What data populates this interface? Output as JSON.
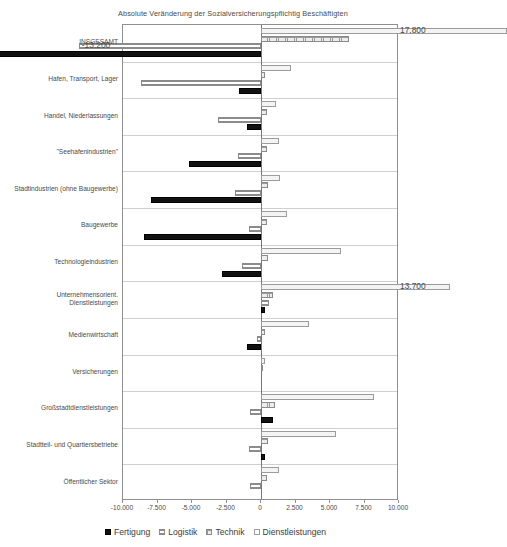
{
  "chart_data": {
    "type": "bar",
    "orientation": "horizontal",
    "grouped": true,
    "title": "Absolute Veränderung der Sozialversicherungspflichtig Beschäftigten",
    "xlabel": "",
    "ylabel": "",
    "xlim": [
      -10000,
      10000
    ],
    "xticks": [
      -10000,
      -7500,
      -5000,
      -2500,
      0,
      2500,
      5000,
      7500,
      10000
    ],
    "xtick_labels": [
      "-10.000",
      "-7.500",
      "-5.000",
      "-2.500",
      "0",
      "2.500",
      "5.000",
      "7.500",
      "10.000"
    ],
    "grid": true,
    "legend_position": "bottom",
    "categories": [
      "INSGESAMT",
      "Hafen, Transport, Lager",
      "Handel, Niederlassungen",
      "\"Seehafenindustrien\"",
      "Stadtindustrien (ohne Baugewerbe)",
      "Baugewerbe",
      "Technologieindustrien",
      "Unternehmensorient. Dienstleistungen",
      "Medienwirtschaft",
      "Versicherungen",
      "Großstadtdienstleistungen",
      "Stadtteil- und Quartiersbetriebe",
      "Öffentlicher Sektor"
    ],
    "series": [
      {
        "name": "Dienstleistungen",
        "values": [
          17800,
          2200,
          1100,
          1300,
          1400,
          1900,
          5800,
          13700,
          3500,
          300,
          8200,
          5400,
          1300
        ]
      },
      {
        "name": "Technik",
        "values": [
          6400,
          300,
          400,
          400,
          500,
          400,
          500,
          900,
          300,
          100,
          1000,
          500,
          400
        ]
      },
      {
        "name": "Logistik",
        "values": [
          -13200,
          -8700,
          -3100,
          -1700,
          -1900,
          -900,
          -1400,
          600,
          -300,
          0,
          -800,
          -900,
          -800
        ]
      },
      {
        "name": "Fertigung",
        "values": [
          -24500,
          -1600,
          -1000,
          -5200,
          -8000,
          -8500,
          -2800,
          300,
          -1000,
          0,
          900,
          300,
          0
        ]
      }
    ],
    "annotations": [
      {
        "label": "17.800",
        "series": "Dienstleistungen",
        "category": "INSGESAMT"
      },
      {
        "label": "-13.200",
        "series": "Logistik",
        "category": "INSGESAMT"
      },
      {
        "label": "-24.500",
        "series": "Fertigung",
        "category": "INSGESAMT"
      },
      {
        "label": "13.700",
        "series": "Dienstleistungen",
        "category": "Unternehmensorient. Dienstleistungen"
      }
    ],
    "legend": [
      "Fertigung",
      "Logistik",
      "Technik",
      "Dienstleistungen"
    ],
    "colors": {
      "Fertigung": "#121212",
      "Logistik": "#f2f2f2",
      "Technik": "#ededed",
      "Dienstleistungen": "#f4f4f4",
      "axis": "#8e8e8e",
      "grid": "#cfcfcf",
      "text": "#4a4a4a"
    }
  }
}
